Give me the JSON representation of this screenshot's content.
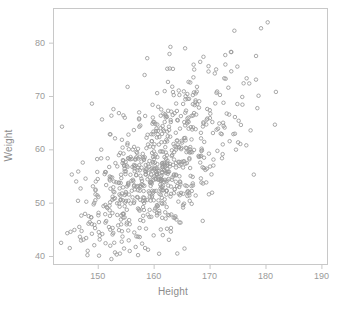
{
  "chart_data": {
    "type": "scatter",
    "title": "",
    "xlabel": "Height",
    "ylabel": "Weight",
    "xlim": [
      142,
      191
    ],
    "ylim": [
      38.5,
      86.5
    ],
    "xticks": [
      150,
      160,
      170,
      180,
      190
    ],
    "yticks": [
      40,
      50,
      60,
      70,
      80
    ],
    "grid": false,
    "legend": null,
    "marker": "open-circle",
    "marker_color": "#9a9a9a",
    "n_points": 760,
    "relationship": "positive linear correlation between Height (cm) and Weight (kg)",
    "stats": {
      "mean_x": 160.5,
      "sd_x": 7.2,
      "mean_y": 56.0,
      "sd_y": 8.4,
      "correlation": 0.66
    },
    "series": [
      {
        "name": "observations",
        "x_range_observed": [
          143,
          190
        ],
        "y_range_observed": [
          39.8,
          85.8
        ]
      }
    ]
  },
  "plot": {
    "frame": {
      "left": 53,
      "top": 8,
      "right": 327,
      "bottom": 264
    },
    "frame_color": "#c8c8c8",
    "background": "#ffffff"
  },
  "labels": {
    "x_axis": "Height",
    "y_axis": "Weight",
    "x_ticks": [
      "150",
      "160",
      "170",
      "180",
      "190"
    ],
    "y_ticks": [
      "80",
      "70",
      "60",
      "50",
      "40"
    ],
    "caption": ""
  }
}
